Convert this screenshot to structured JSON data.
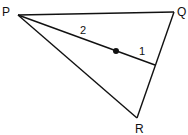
{
  "diagram": {
    "type": "triangle-median",
    "vertices": {
      "P": {
        "label": "P",
        "x": 18,
        "y": 15
      },
      "Q": {
        "label": "Q",
        "x": 174,
        "y": 12
      },
      "R": {
        "label": "R",
        "x": 137,
        "y": 118
      }
    },
    "median_foot": {
      "x": 155,
      "y": 65
    },
    "centroid_point": {
      "x": 116,
      "y": 51
    },
    "segment_labels": {
      "upper": "2",
      "lower": "1"
    },
    "stroke_color": "#111111"
  }
}
